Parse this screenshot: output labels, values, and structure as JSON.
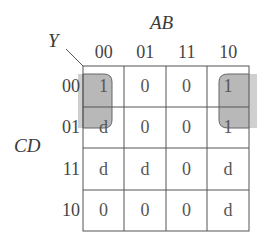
{
  "output_label": "Y",
  "col_var_label": "AB",
  "row_var_label": "CD",
  "col_headers": [
    "00",
    "01",
    "11",
    "10"
  ],
  "row_headers": [
    "00",
    "01",
    "11",
    "10"
  ],
  "cells": [
    [
      "1",
      "0",
      "0",
      "1"
    ],
    [
      "d",
      "0",
      "0",
      "1"
    ],
    [
      "d",
      "d",
      "0",
      "d"
    ],
    [
      "0",
      "0",
      "0",
      "d"
    ]
  ],
  "groups": [
    {
      "name": "wrap-around-group",
      "cells": [
        [
          0,
          0
        ],
        [
          1,
          0
        ],
        [
          0,
          3
        ],
        [
          1,
          3
        ]
      ],
      "color": "#b3b3b3"
    }
  ]
}
